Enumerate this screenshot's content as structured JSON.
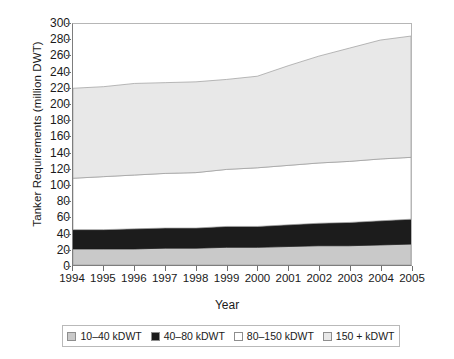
{
  "chart_data": {
    "type": "area",
    "title": "",
    "xlabel": "Year",
    "ylabel": "Tanker Requirements (million DWT)",
    "x": [
      1994,
      1995,
      1996,
      1997,
      1998,
      1999,
      2000,
      2001,
      2002,
      2003,
      2004,
      2005
    ],
    "xtick_labels": [
      "1994",
      "1995",
      "1996",
      "1997",
      "1998",
      "1999",
      "2000",
      "2001",
      "2002",
      "2003",
      "2004",
      "2005"
    ],
    "ytick_labels": [
      "300",
      "280",
      "260",
      "240",
      "220",
      "200",
      "180",
      "160",
      "140",
      "120",
      "100",
      "80",
      "60",
      "40",
      "20",
      "0"
    ],
    "ylim": [
      0,
      300
    ],
    "ytick_step": 20,
    "grid": false,
    "stacked": true,
    "legend_position": "bottom",
    "series": [
      {
        "name": "10–40 kDWT",
        "color": "#c9c9c9",
        "values": [
          20,
          20,
          20,
          21,
          21,
          22,
          22,
          23,
          24,
          24,
          25,
          26
        ]
      },
      {
        "name": "40–80 kDWT",
        "color": "#1c1c1c",
        "values": [
          24,
          24,
          25,
          25,
          25,
          26,
          26,
          27,
          28,
          29,
          30,
          31
        ]
      },
      {
        "name": "80–150 kDWT",
        "color": "#ffffff",
        "values": [
          64,
          66,
          67,
          68,
          69,
          71,
          73,
          74,
          75,
          76,
          77,
          77
        ]
      },
      {
        "name": "150 + kDWT",
        "color": "#e8e8e8",
        "values": [
          112,
          112,
          114,
          113,
          113,
          112,
          114,
          124,
          133,
          141,
          148,
          151
        ]
      }
    ],
    "cumulative_boundaries": {
      "band1_top": [
        20,
        20,
        20,
        21,
        21,
        22,
        22,
        23,
        24,
        24,
        25,
        26
      ],
      "band2_top": [
        44,
        44,
        45,
        46,
        46,
        48,
        48,
        50,
        52,
        53,
        55,
        57
      ],
      "band3_top": [
        108,
        110,
        112,
        114,
        115,
        119,
        121,
        124,
        127,
        129,
        132,
        134
      ],
      "band4_top": [
        220,
        222,
        226,
        227,
        228,
        231,
        235,
        248,
        260,
        270,
        280,
        285
      ]
    }
  },
  "legend": {
    "items": [
      {
        "label": "10–40 kDWT",
        "color": "#c9c9c9"
      },
      {
        "label": "40–80 kDWT",
        "color": "#1c1c1c"
      },
      {
        "label": "80–150 kDWT",
        "color": "#ffffff"
      },
      {
        "label": "150 + kDWT",
        "color": "#e8e8e8"
      }
    ]
  }
}
